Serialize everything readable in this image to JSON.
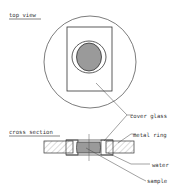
{
  "diagram": {
    "top_view": {
      "heading": "top view"
    },
    "cross_section": {
      "heading": "cross section"
    },
    "labels": {
      "cover_glass": "cover glass",
      "metal_ring": "metal ring",
      "water": "water",
      "sample": "sample"
    },
    "colors": {
      "line": "#333333",
      "sample_fill": "#9a9a9a",
      "hatch": "#888888"
    }
  }
}
